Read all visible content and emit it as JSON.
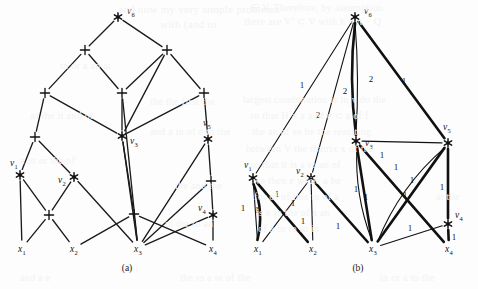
{
  "figure": {
    "caption_a": "(a)",
    "caption_b": "(b)",
    "background_color": "#fdfdfd",
    "ink_color": "#1b1b1b"
  },
  "ghost_text": [
    {
      "text": "and now my very simple problems",
      "x": 118,
      "y": 3,
      "size": 11
    },
    {
      "text": "with (and  to",
      "x": 160,
      "y": 18,
      "size": 11
    },
    {
      "text": "∈ V. Therefore, by assumption",
      "x": 250,
      "y": 2,
      "size": 10
    },
    {
      "text": "there are V’  ⊂ V  with  h = π − Q",
      "x": 244,
      "y": 16,
      "size": 10
    },
    {
      "text": "the the first the",
      "x": 150,
      "y": 96,
      "size": 10
    },
    {
      "text": "largest combination  is   in  v  do the",
      "x": 243,
      "y": 94,
      "size": 10
    },
    {
      "text": "so   that   H ≠ a  a  of  e  ⊂   a  of  f",
      "x": 250,
      "y": 110,
      "size": 10
    },
    {
      "text": "the  an  of  ee  be  the  resulting",
      "x": 252,
      "y": 126,
      "size": 10
    },
    {
      "text": "and a in of e to the",
      "x": 150,
      "y": 126,
      "size": 10
    },
    {
      "text": "between V the matrix x of the",
      "x": 246,
      "y": 143,
      "size": 10
    },
    {
      "text": "so that it is a to an of",
      "x": 250,
      "y": 159,
      "size": 10
    },
    {
      "text": "we then e while a be",
      "x": 253,
      "y": 175,
      "size": 10
    },
    {
      "text": "for of of this to of a",
      "x": 254,
      "y": 191,
      "size": 10
    },
    {
      "text": "is e in the of a an",
      "x": 256,
      "y": 207,
      "size": 10
    },
    {
      "text": "of a to to to in",
      "x": 258,
      "y": 223,
      "size": 10
    },
    {
      "text": "in or a an at",
      "x": 60,
      "y": 60,
      "size": 10
    },
    {
      "text": "as the it and of",
      "x": 30,
      "y": 110,
      "size": 10
    },
    {
      "text": "a in or the of",
      "x": 20,
      "y": 155,
      "size": 10
    },
    {
      "text": "the and the",
      "x": 175,
      "y": 180,
      "size": 10
    },
    {
      "text": "in the to an",
      "x": 165,
      "y": 218,
      "size": 10
    },
    {
      "text": "and a e",
      "x": 20,
      "y": 272,
      "size": 10
    },
    {
      "text": "the to a in of the",
      "x": 180,
      "y": 272,
      "size": 10
    },
    {
      "text": "in or a to the",
      "x": 380,
      "y": 272,
      "size": 10
    },
    {
      "text": "at the",
      "x": 436,
      "y": 191,
      "size": 10
    }
  ],
  "panel_a": {
    "label": "(a)",
    "caption_pos": {
      "x": 127,
      "y": 271
    },
    "nodes": [
      {
        "id": "v6",
        "kind": "star",
        "x": 118,
        "y": 17,
        "label": "v",
        "sub": "6",
        "lx": 127,
        "ly": 14
      },
      {
        "id": "pA",
        "kind": "plus",
        "x": 85,
        "y": 50
      },
      {
        "id": "pB",
        "kind": "plus",
        "x": 167,
        "y": 50
      },
      {
        "id": "pC",
        "kind": "plus",
        "x": 45,
        "y": 93
      },
      {
        "id": "pD",
        "kind": "plus",
        "x": 122,
        "y": 93
      },
      {
        "id": "pE",
        "kind": "plus",
        "x": 204,
        "y": 93
      },
      {
        "id": "v3",
        "kind": "star",
        "x": 122,
        "y": 136,
        "label": "v",
        "sub": "3",
        "lx": 130,
        "ly": 144
      },
      {
        "id": "v5",
        "kind": "star",
        "x": 208,
        "y": 139,
        "label": "v",
        "sub": "5",
        "lx": 203,
        "ly": 126
      },
      {
        "id": "pF",
        "kind": "plus",
        "x": 35,
        "y": 137
      },
      {
        "id": "v1",
        "kind": "star",
        "x": 20,
        "y": 175,
        "label": "v",
        "sub": "1",
        "lx": 10,
        "ly": 166
      },
      {
        "id": "v2",
        "kind": "star",
        "x": 74,
        "y": 177,
        "label": "v",
        "sub": "2",
        "lx": 58,
        "ly": 183
      },
      {
        "id": "pG",
        "kind": "plus",
        "x": 211,
        "y": 181
      },
      {
        "id": "v4",
        "kind": "star",
        "x": 213,
        "y": 215,
        "label": "v",
        "sub": "4",
        "lx": 198,
        "ly": 211
      },
      {
        "id": "pH",
        "kind": "plus",
        "x": 49,
        "y": 215
      },
      {
        "id": "pI",
        "kind": "plus",
        "x": 134,
        "y": 214
      },
      {
        "id": "x1",
        "kind": "term",
        "x": 22,
        "y": 248,
        "label": "x",
        "sub": "1"
      },
      {
        "id": "x2",
        "kind": "term",
        "x": 74,
        "y": 248,
        "label": "x",
        "sub": "2"
      },
      {
        "id": "x3",
        "kind": "term",
        "x": 138,
        "y": 248,
        "label": "x",
        "sub": "3"
      },
      {
        "id": "x4",
        "kind": "term",
        "x": 213,
        "y": 248,
        "label": "x",
        "sub": "4"
      }
    ],
    "edges": [
      [
        "v6",
        "pA"
      ],
      [
        "v6",
        "pB"
      ],
      [
        "pA",
        "pC"
      ],
      [
        "pA",
        "pD"
      ],
      [
        "pB",
        "pD"
      ],
      [
        "pB",
        "pE"
      ],
      [
        "pB",
        "v3"
      ],
      [
        "pC",
        "pF"
      ],
      [
        "pC",
        "v3"
      ],
      [
        "pD",
        "v3"
      ],
      [
        "pD",
        "x3"
      ],
      [
        "pE",
        "v3"
      ],
      [
        "pE",
        "v5"
      ],
      [
        "pF",
        "v1"
      ],
      [
        "pF",
        "v2"
      ],
      [
        "v1",
        "pH"
      ],
      [
        "v1",
        "x1"
      ],
      [
        "v2",
        "pH"
      ],
      [
        "v2",
        "x3"
      ],
      [
        "v3",
        "pI"
      ],
      [
        "v3",
        "x3"
      ],
      [
        "v5",
        "pG"
      ],
      [
        "v5",
        "x3"
      ],
      [
        "pG",
        "v4"
      ],
      [
        "pG",
        "x3"
      ],
      [
        "v4",
        "x3"
      ],
      [
        "v4",
        "x4"
      ],
      [
        "pH",
        "x1"
      ],
      [
        "pH",
        "x2"
      ],
      [
        "pI",
        "x2"
      ],
      [
        "pI",
        "x3"
      ],
      [
        "pI",
        "x4"
      ]
    ]
  },
  "panel_b": {
    "label": "(b)",
    "caption_pos": {
      "x": 358,
      "y": 271
    },
    "nodes": [
      {
        "id": "v6",
        "kind": "star",
        "x": 355,
        "y": 17,
        "label": "v",
        "sub": "6",
        "lx": 364,
        "ly": 14
      },
      {
        "id": "v3",
        "kind": "star",
        "x": 356,
        "y": 141,
        "label": "v",
        "sub": "3",
        "lx": 365,
        "ly": 146
      },
      {
        "id": "v5",
        "kind": "star",
        "x": 448,
        "y": 143,
        "label": "v",
        "sub": "5",
        "lx": 443,
        "ly": 130
      },
      {
        "id": "v1",
        "kind": "star",
        "x": 253,
        "y": 178,
        "label": "v",
        "sub": "1",
        "lx": 244,
        "ly": 168
      },
      {
        "id": "v2",
        "kind": "star",
        "x": 311,
        "y": 178,
        "label": "v",
        "sub": "2",
        "lx": 296,
        "ly": 174
      },
      {
        "id": "v4",
        "kind": "star",
        "x": 448,
        "y": 224,
        "label": "v",
        "sub": "4",
        "lx": 455,
        "ly": 218
      },
      {
        "id": "x1",
        "kind": "term",
        "x": 258,
        "y": 248,
        "label": "x",
        "sub": "1"
      },
      {
        "id": "x2",
        "kind": "term",
        "x": 313,
        "y": 248,
        "label": "x",
        "sub": "2"
      },
      {
        "id": "x3",
        "kind": "term",
        "x": 373,
        "y": 248,
        "label": "x",
        "sub": "3"
      },
      {
        "id": "x4",
        "kind": "term",
        "x": 449,
        "y": 248,
        "label": "x",
        "sub": "4"
      }
    ],
    "edges": [
      {
        "from": "v6",
        "to": "v1",
        "weight": "1",
        "style": "thin",
        "wx": 302,
        "wy": 88
      },
      {
        "from": "v6",
        "to": "v2",
        "weight": "2",
        "style": "thin",
        "wx": 318,
        "wy": 118
      },
      {
        "from": "v6",
        "to": "v3",
        "weight": "2",
        "style": "thin",
        "wx": 345,
        "wy": 94,
        "curve": -4
      },
      {
        "from": "v6",
        "to": "v3",
        "weight": "2",
        "style": "thick",
        "wx": 371,
        "wy": 82,
        "curve": 7
      },
      {
        "from": "v6",
        "to": "v5",
        "weight": "1",
        "style": "thick",
        "wx": 404,
        "wy": 84
      },
      {
        "from": "v3",
        "to": "v5",
        "weight": "1",
        "style": "thin",
        "wx": 382,
        "wy": 158
      },
      {
        "from": "v1",
        "to": "x1",
        "weight": "1",
        "style": "thick",
        "wx": 243,
        "wy": 211,
        "curve": -9
      },
      {
        "from": "v1",
        "to": "x1",
        "weight": "1",
        "style": "thin",
        "wx": 257,
        "wy": 213
      },
      {
        "from": "v1",
        "to": "x2",
        "weight": "1",
        "style": "thick",
        "wx": 277,
        "wy": 197
      },
      {
        "from": "v2",
        "to": "x1",
        "weight": "1",
        "style": "thin",
        "wx": 293,
        "wy": 206
      },
      {
        "from": "v2",
        "to": "x2",
        "weight": "1",
        "style": "thin",
        "wx": 303,
        "wy": 224
      },
      {
        "from": "v2",
        "to": "x3",
        "weight": "1",
        "style": "thick",
        "wx": 338,
        "wy": 229
      },
      {
        "from": "v3",
        "to": "x3",
        "weight": "1",
        "style": "thick",
        "wx": 356,
        "wy": 192
      },
      {
        "from": "v3",
        "to": "x3",
        "weight": "1",
        "style": "thin",
        "wx": 366,
        "wy": 200,
        "curve": 10
      },
      {
        "from": "v3",
        "to": "x4",
        "weight": "1",
        "style": "thick",
        "wx": 412,
        "wy": 183
      },
      {
        "from": "v5",
        "to": "x3",
        "weight": "1",
        "style": "thick",
        "wx": 405,
        "wy": 198
      },
      {
        "from": "v5",
        "to": "x3",
        "weight": "1",
        "style": "thin",
        "wx": 396,
        "wy": 170,
        "curve": 14
      },
      {
        "from": "v5",
        "to": "v4",
        "weight": "1",
        "style": "thick",
        "wx": 442,
        "wy": 190
      },
      {
        "from": "v4",
        "to": "x3",
        "weight": "1",
        "style": "thin",
        "wx": 410,
        "wy": 231
      },
      {
        "from": "v4",
        "to": "x4",
        "weight": "1",
        "style": "thick",
        "wx": 454,
        "wy": 240
      }
    ]
  }
}
